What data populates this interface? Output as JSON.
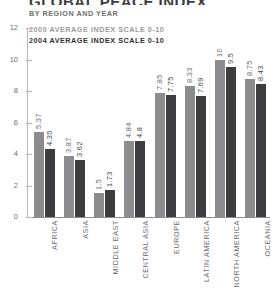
{
  "header": {
    "title": "GLOBAL PEACE INDEX",
    "subtitle": "BY REGION AND YEAR"
  },
  "legend": {
    "position": "top-left",
    "items": [
      {
        "label": "2000 AVERAGE INDEX SCALE 0-10",
        "color": "#9a9a9c"
      },
      {
        "label": "2004 AVERAGE INDEX SCALE 0-10",
        "color": "#2f2f31"
      }
    ]
  },
  "axis": {
    "y_ticks": [
      "0",
      "2",
      "4",
      "6",
      "8",
      "10",
      "12"
    ]
  },
  "chart_data": {
    "type": "bar",
    "title": "GLOBAL PEACE INDEX",
    "subtitle": "BY REGION AND YEAR",
    "xlabel": "",
    "ylabel": "",
    "ylim": [
      0,
      12
    ],
    "yticks": [
      0,
      2,
      4,
      6,
      8,
      10,
      12
    ],
    "grid": false,
    "legend_position": "top-left",
    "categories": [
      "AFRICA",
      "ASIA",
      "MIDDLE EAST",
      "CENTRAL ASIA",
      "EUROPE",
      "LATIN AMERICA",
      "NORTH AMERICA",
      "OCEANIA"
    ],
    "series": [
      {
        "name": "2000 AVERAGE INDEX SCALE 0-10",
        "color": "#8c8c8e",
        "values": [
          5.37,
          3.87,
          1.5,
          4.84,
          7.85,
          8.33,
          10,
          8.75
        ],
        "labels": [
          "5.37",
          "3.87",
          "1.5",
          "4.84",
          "7.85",
          "8.33",
          "10",
          "8.75"
        ]
      },
      {
        "name": "2004 AVERAGE INDEX SCALE 0-10",
        "color": "#3d3d3f",
        "values": [
          4.35,
          3.62,
          1.73,
          4.8,
          7.75,
          7.69,
          9.5,
          8.43
        ],
        "labels": [
          "4.35",
          "3.62",
          "1.73",
          "4.8",
          "7.75",
          "7.69",
          "9.5",
          "8.43"
        ]
      }
    ]
  }
}
